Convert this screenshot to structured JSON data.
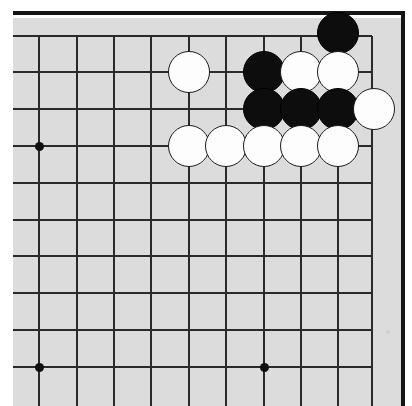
{
  "app": {
    "title": "Go Board Diagram",
    "description": "Go (Weiqi / Baduk) board upper-right corner position diagram"
  },
  "board": {
    "size": 19,
    "visible_region": "upper-right corner",
    "surface_color": "#dcdcdc",
    "line_color": "#2a2a2a",
    "border_color": "#151515",
    "black_stone_color": "#0d0d0d",
    "white_stone_color": "#fdfdfd",
    "stone_radius_px": 21,
    "grid": {
      "columns_x": [
        39,
        77,
        114,
        151,
        189,
        226,
        264,
        301,
        338,
        372
      ],
      "rows_y": [
        36,
        72,
        109,
        146,
        183,
        220,
        256,
        293,
        330,
        367
      ],
      "edge_top_y": 11,
      "edge_right_x": 401,
      "surface_left_x": 13,
      "surface_top_y": 18
    },
    "star_points": [
      {
        "name": "star-point-left-upper",
        "x": 39,
        "y": 146
      },
      {
        "name": "star-point-left-lower",
        "x": 39,
        "y": 367
      },
      {
        "name": "star-point-center-lower",
        "x": 264,
        "y": 367
      }
    ],
    "stones": [
      {
        "color": "black",
        "x": 338,
        "y": 33,
        "label": "black-stone-1"
      },
      {
        "color": "white",
        "x": 189,
        "y": 72,
        "label": "white-stone-1"
      },
      {
        "color": "black",
        "x": 264,
        "y": 72,
        "label": "black-stone-2"
      },
      {
        "color": "white",
        "x": 301,
        "y": 72,
        "label": "white-stone-2"
      },
      {
        "color": "white",
        "x": 338,
        "y": 72,
        "label": "white-stone-3"
      },
      {
        "color": "black",
        "x": 264,
        "y": 109,
        "label": "black-stone-3"
      },
      {
        "color": "black",
        "x": 301,
        "y": 109,
        "label": "black-stone-4"
      },
      {
        "color": "black",
        "x": 338,
        "y": 109,
        "label": "black-stone-5"
      },
      {
        "color": "white",
        "x": 374,
        "y": 109,
        "label": "white-stone-4"
      },
      {
        "color": "white",
        "x": 189,
        "y": 146,
        "label": "white-stone-5"
      },
      {
        "color": "white",
        "x": 226,
        "y": 146,
        "label": "white-stone-6"
      },
      {
        "color": "white",
        "x": 264,
        "y": 146,
        "label": "white-stone-7"
      },
      {
        "color": "white",
        "x": 301,
        "y": 146,
        "label": "white-stone-8"
      },
      {
        "color": "white",
        "x": 338,
        "y": 146,
        "label": "white-stone-9"
      }
    ],
    "marks": [
      {
        "name": "faint-mark",
        "x": 386,
        "y": 330
      }
    ],
    "counts": {
      "black_stones": 6,
      "white_stones": 9,
      "total_stones": 15
    }
  }
}
